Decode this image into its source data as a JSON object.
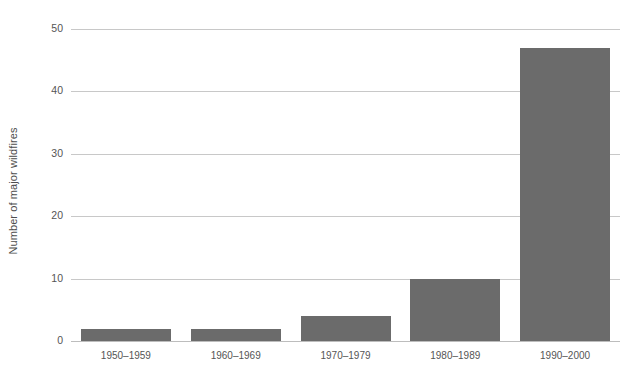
{
  "chart_data": {
    "type": "bar",
    "title": "",
    "subtitle": "",
    "xlabel": "",
    "ylabel": "Number of major wildfires",
    "categories": [
      "1950–1959",
      "1960–1969",
      "1970–1979",
      "1980–1989",
      "1990–2000"
    ],
    "values": [
      2,
      2,
      4,
      10,
      47
    ],
    "ylim": [
      0,
      50
    ],
    "yticks": [
      0,
      10,
      20,
      30,
      40,
      50
    ],
    "ytick_labels": [
      "0",
      "10",
      "20",
      "30",
      "40",
      "50"
    ],
    "grid": true,
    "legend": false,
    "legend_position": "none",
    "bar_color": "#6b6b6b",
    "gridline_color": "#c8c8c8",
    "background_color": "#ffffff",
    "text_color": "#555555"
  }
}
